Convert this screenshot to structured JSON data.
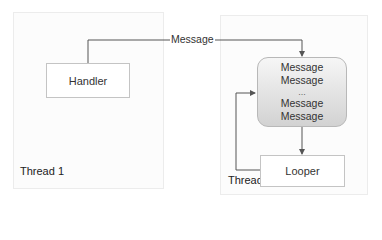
{
  "threads": [
    {
      "label": "Thread 1"
    },
    {
      "label": "Thread 2"
    }
  ],
  "handler": {
    "label": "Handler"
  },
  "looper": {
    "label": "Looper"
  },
  "message_queue": {
    "items": [
      "Message",
      "Message",
      "...",
      "Message",
      "Message"
    ]
  },
  "send_arrow": {
    "label": "Message"
  },
  "colors": {
    "line": "#555555",
    "queue_top": "#f6f6f6",
    "queue_bottom": "#d2d2d2"
  }
}
